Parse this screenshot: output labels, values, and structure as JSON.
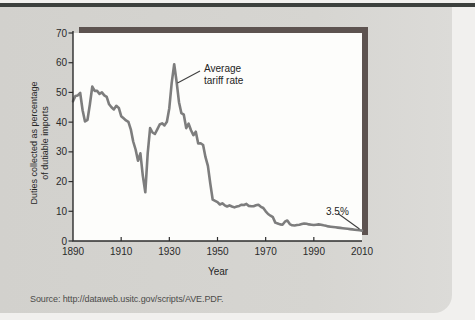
{
  "figure": {
    "source_text": "Source: http://dataweb.usitc.gov/scripts/AVE.PDF."
  },
  "colors": {
    "page_bg": "#f1f0ee",
    "top_rule": "#3c403d",
    "panel_bg": "#d5d4d0",
    "shadow_bar": "#5d5350",
    "plot_bg": "#fdfdfb",
    "series_line": "#7d7d7d",
    "axis": "#2d2d2d",
    "text": "#262626"
  },
  "chart_data": {
    "type": "line",
    "title": "",
    "xlabel": "Year",
    "ylabel": "Duties collected as percentage\nof dutiable imports",
    "xlim": [
      1890,
      2010
    ],
    "ylim": [
      0,
      70
    ],
    "grid": false,
    "legend_position": "none",
    "x_start": 1890,
    "x_step": 1,
    "x_ticks": [
      1890,
      1910,
      1930,
      1950,
      1970,
      1990,
      2010
    ],
    "y_ticks": [
      0,
      10,
      20,
      30,
      40,
      50,
      60,
      70
    ],
    "series": [
      {
        "name": "Average tariff rate",
        "values": [
          47.0,
          48.8,
          49.0,
          49.8,
          44.0,
          40.2,
          40.8,
          46.0,
          52.0,
          50.5,
          50.5,
          49.5,
          50.0,
          49.0,
          48.5,
          46.0,
          45.0,
          44.3,
          45.5,
          44.8,
          42.0,
          41.3,
          40.6,
          40.1,
          37.6,
          33.5,
          30.8,
          27.0,
          29.5,
          22.0,
          16.4,
          29.5,
          38.0,
          36.5,
          36.0,
          37.6,
          39.2,
          39.6,
          38.9,
          40.1,
          44.7,
          53.2,
          59.5,
          53.6,
          46.7,
          43.0,
          42.5,
          38.0,
          39.5,
          37.3,
          35.6,
          36.8,
          32.8,
          32.9,
          32.3,
          28.2,
          25.3,
          19.3,
          13.9,
          13.5,
          13.1,
          12.3,
          12.7,
          12.0,
          11.6,
          12.0,
          11.6,
          11.3,
          11.6,
          11.8,
          12.2,
          12.1,
          12.5,
          11.8,
          11.7,
          11.7,
          12.0,
          12.2,
          11.5,
          11.1,
          10.0,
          9.1,
          8.5,
          8.0,
          6.2,
          5.9,
          5.6,
          5.5,
          6.5,
          6.9,
          5.7,
          5.3,
          5.2,
          5.4,
          5.5,
          5.7,
          5.9,
          5.8,
          5.6,
          5.5,
          5.4,
          5.5,
          5.6,
          5.5,
          5.3,
          5.1,
          4.9,
          4.8,
          4.7,
          4.6,
          4.5,
          4.4,
          4.3,
          4.2,
          4.1,
          4.0,
          3.9,
          3.8,
          3.7,
          3.6,
          3.5
        ]
      }
    ],
    "annotations": [
      {
        "text": "Average\ntariff rate",
        "target_year": 1932,
        "target_value": 59.5
      },
      {
        "text": "3.5%",
        "target_year": 2010,
        "target_value": 3.5
      }
    ]
  }
}
